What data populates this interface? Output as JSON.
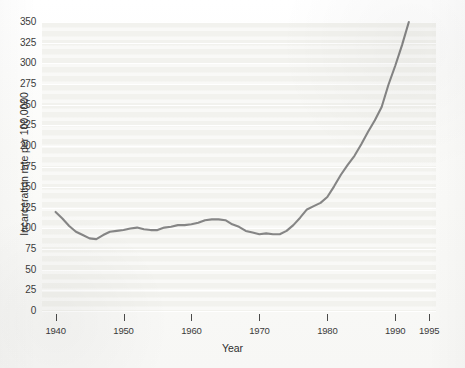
{
  "chart_data": {
    "type": "line",
    "title": "",
    "xlabel": "Year",
    "ylabel": "Incarceration rate per 100,0000",
    "xlim": [
      1938,
      1996
    ],
    "ylim": [
      0,
      350
    ],
    "grid": true,
    "legend": null,
    "xticks": [
      1940,
      1950,
      1960,
      1970,
      1980,
      1990,
      1995
    ],
    "xtick_labels": [
      "1940",
      "1950",
      "1960",
      "1970",
      "1980",
      "1990",
      "1995"
    ],
    "yticks": [
      0,
      25,
      50,
      75,
      100,
      125,
      150,
      175,
      200,
      225,
      250,
      275,
      300,
      325,
      350
    ],
    "ytick_labels": [
      "0",
      "25",
      "50",
      "75",
      "100",
      "125",
      "150",
      "175",
      "200",
      "225",
      "250",
      "275",
      "300",
      "325",
      "350"
    ],
    "series": [
      {
        "name": "Incarceration rate",
        "color": "#7c7c7c",
        "x": [
          1940,
          1941,
          1942,
          1943,
          1944,
          1945,
          1946,
          1947,
          1948,
          1949,
          1950,
          1951,
          1952,
          1953,
          1954,
          1955,
          1956,
          1957,
          1958,
          1959,
          1960,
          1961,
          1962,
          1963,
          1964,
          1965,
          1966,
          1967,
          1968,
          1969,
          1970,
          1971,
          1972,
          1973,
          1974,
          1975,
          1976,
          1977,
          1978,
          1979,
          1980,
          1981,
          1982,
          1983,
          1984,
          1985,
          1986,
          1987,
          1988,
          1989,
          1990,
          1991,
          1992
        ],
        "values": [
          120,
          112,
          103,
          96,
          92,
          88,
          87,
          92,
          96,
          97,
          98,
          100,
          101,
          99,
          98,
          98,
          101,
          102,
          104,
          104,
          105,
          107,
          110,
          111,
          111,
          110,
          105,
          102,
          97,
          95,
          93,
          94,
          93,
          93,
          97,
          104,
          113,
          123,
          127,
          131,
          138,
          151,
          165,
          177,
          188,
          202,
          217,
          231,
          247,
          274,
          297,
          322,
          350
        ]
      }
    ]
  },
  "axis": {
    "x_title": "Year",
    "y_title": "Incarceration rate per 100,0000"
  },
  "colors": {
    "line": "#7c7c7c",
    "plot_background": "#f2f2ee",
    "grid": "#ffffff",
    "text": "#3b3b3b"
  }
}
